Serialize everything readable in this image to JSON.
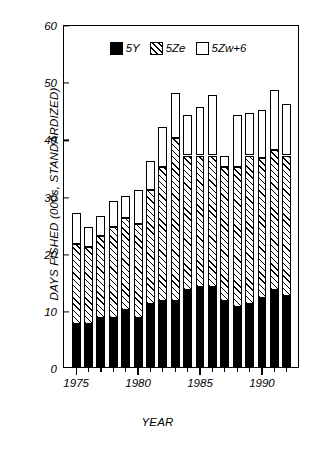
{
  "chart_data": {
    "type": "bar",
    "stacked": true,
    "title": "",
    "xlabel": "YEAR",
    "ylabel": "DAYS FISHED (000s, STANDARDIZED)",
    "ylim": [
      0,
      60
    ],
    "ytick_values": [
      0,
      10,
      20,
      30,
      40,
      50,
      60
    ],
    "ytick_labels": [
      "0",
      "10",
      "20",
      "30",
      "40",
      "50",
      "60"
    ],
    "xtick_labels": [
      "1975",
      "1980",
      "1985",
      "1990"
    ],
    "xtick_values": [
      1975,
      1980,
      1985,
      1990
    ],
    "grid": false,
    "legend_position": "top-center",
    "categories": [
      "1975",
      "1976",
      "1977",
      "1978",
      "1979",
      "1980",
      "1981",
      "1982",
      "1983",
      "1984",
      "1985",
      "1986",
      "1987",
      "1988",
      "1989",
      "1990",
      "1991",
      "1992"
    ],
    "series": [
      {
        "name": "5Y",
        "color": "#000000",
        "pattern": "solid",
        "values": [
          7.5,
          7.5,
          8.5,
          8.5,
          10.0,
          8.5,
          11.0,
          11.5,
          11.5,
          13.5,
          14.0,
          14.0,
          11.5,
          10.5,
          11.0,
          12.0,
          13.5,
          12.5
        ]
      },
      {
        "name": "5Ze",
        "color": "#ffffff",
        "pattern": "diagonal-hatch",
        "values": [
          14.0,
          13.5,
          14.5,
          16.0,
          16.0,
          16.5,
          20.0,
          23.5,
          28.5,
          23.5,
          23.0,
          23.0,
          23.5,
          24.5,
          26.0,
          24.5,
          24.5,
          24.5
        ]
      },
      {
        "name": "5Zw+6",
        "color": "#ffffff",
        "pattern": "none",
        "values": [
          5.5,
          3.5,
          3.5,
          4.5,
          4.0,
          6.0,
          5.0,
          7.0,
          8.0,
          7.0,
          8.5,
          10.5,
          2.0,
          9.0,
          7.5,
          8.5,
          10.5,
          9.0
        ]
      }
    ],
    "totals": [
      27.0,
      24.5,
      26.5,
      29.0,
      30.0,
      31.0,
      36.0,
      42.0,
      48.0,
      44.0,
      45.5,
      47.5,
      37.0,
      44.0,
      44.5,
      45.0,
      48.5,
      46.0
    ]
  },
  "legend": {
    "items": [
      {
        "label": "5Y"
      },
      {
        "label": "5Ze"
      },
      {
        "label": "5Zw+6"
      }
    ]
  }
}
